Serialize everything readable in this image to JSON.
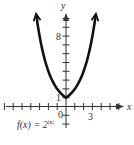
{
  "chart_data": {
    "type": "line",
    "title": "",
    "function_label": "f(x) = 2^|x|",
    "function_label_base": "f(x) = 2",
    "function_label_exp": "|x|",
    "xlabel": "x",
    "ylabel": "y",
    "xlim": [
      -7,
      6
    ],
    "ylim": [
      -2,
      10
    ],
    "x_tick_labels": [
      {
        "value": 0,
        "label": "0"
      },
      {
        "value": 3,
        "label": "3"
      }
    ],
    "y_tick_labels": [
      {
        "value": 1,
        "label": "1"
      },
      {
        "value": 8,
        "label": "8"
      }
    ],
    "grid": false,
    "series": [
      {
        "name": "f(x) = 2^|x|",
        "x": [
          -3.35,
          -3,
          -2,
          -1,
          0,
          1,
          2,
          3,
          3.35
        ],
        "y": [
          10.2,
          8,
          4,
          2,
          1,
          2,
          4,
          8,
          10.2
        ],
        "color": "#111111",
        "arrows_at_ends": true
      }
    ]
  },
  "labels": {
    "x_axis": "x",
    "y_axis": "y",
    "tick_0": "0",
    "tick_3": "3",
    "tick_1": "1",
    "tick_8": "8"
  }
}
